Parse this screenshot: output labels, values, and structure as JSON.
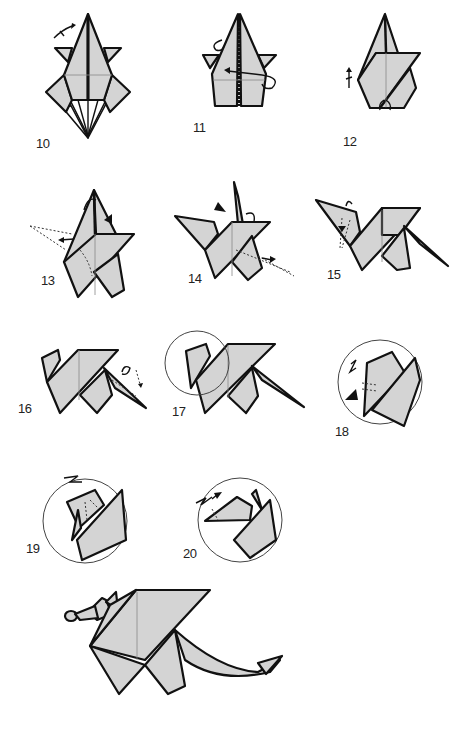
{
  "diagram": {
    "paper_color": "#d4d4d4",
    "line_color": "#111111",
    "steps": [
      {
        "number": "10",
        "description": "Pleat/valley folds with fold arrow at top-left"
      },
      {
        "number": "11",
        "description": "Turn over / rotate arrow, mountain fold at center"
      },
      {
        "number": "12",
        "description": "Fold up flap, small arrows at bottom"
      },
      {
        "number": "13",
        "description": "Inside reverse fold neck to the left"
      },
      {
        "number": "14",
        "description": "Inside reverse fold tail to the right"
      },
      {
        "number": "15",
        "description": "Reverse fold head down"
      },
      {
        "number": "16",
        "description": "Fold tail"
      },
      {
        "number": "17",
        "description": "Close-up circle on head"
      },
      {
        "number": "18",
        "description": "Crimp fold head (close-up)"
      },
      {
        "number": "19",
        "description": "Crimp fold snout (close-up)"
      },
      {
        "number": "20",
        "description": "Crimp snout tip (close-up)"
      },
      {
        "number": "",
        "description": "Finished dragon"
      }
    ]
  }
}
